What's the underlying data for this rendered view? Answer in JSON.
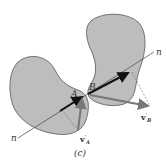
{
  "figure": {
    "caption": "(c)",
    "bodies": [
      {
        "label": "A",
        "fill": "#bdbdbd",
        "stroke": "#555555"
      },
      {
        "label": "B",
        "fill": "#bdbdbd",
        "stroke": "#555555"
      }
    ],
    "line_labels": {
      "start": "n",
      "end": "n"
    },
    "vectors": {
      "vA": {
        "symbol": "v",
        "prime": "′",
        "subscript": "A",
        "color": "#777777"
      },
      "vB": {
        "symbol": "v",
        "prime": "′",
        "subscript": "B",
        "color": "#777777"
      }
    },
    "colors": {
      "normal_arrow": "#111111",
      "line": "#444444",
      "dashed": "#666666"
    }
  }
}
